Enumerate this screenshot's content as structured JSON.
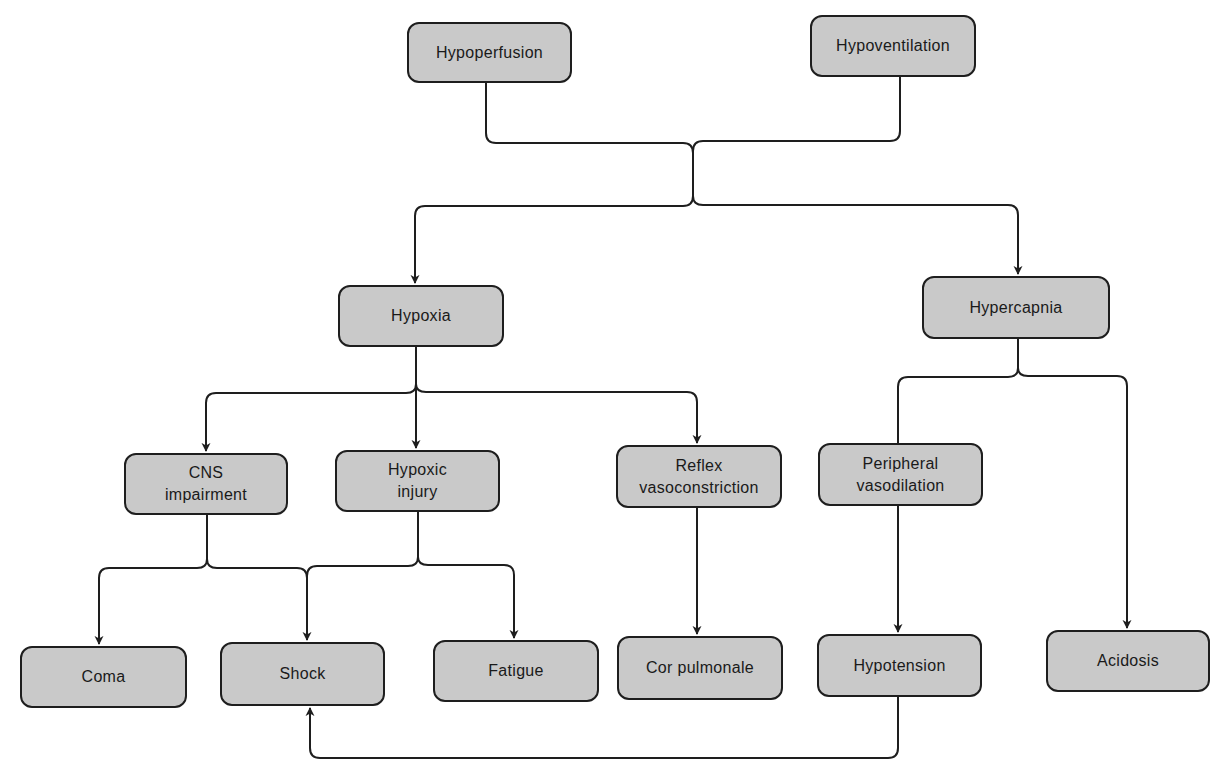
{
  "colors": {
    "node_fill": "#c9c9c9",
    "stroke": "#1e1e1e",
    "background": "#ffffff"
  },
  "nodes": [
    {
      "id": "hypoperfusion",
      "label": "Hypoperfusion",
      "x": 407,
      "y": 22,
      "w": 165,
      "h": 61
    },
    {
      "id": "hypoventilation",
      "label": "Hypoventilation",
      "x": 810,
      "y": 15,
      "w": 166,
      "h": 62
    },
    {
      "id": "hypoxia",
      "label": "Hypoxia",
      "x": 338,
      "y": 285,
      "w": 166,
      "h": 62
    },
    {
      "id": "hypercapnia",
      "label": "Hypercapnia",
      "x": 922,
      "y": 276,
      "w": 188,
      "h": 63
    },
    {
      "id": "cns-impairment",
      "label": "CNS\nimpairment",
      "x": 124,
      "y": 453,
      "w": 164,
      "h": 62
    },
    {
      "id": "hypoxic-injury",
      "label": "Hypoxic\ninjury",
      "x": 335,
      "y": 450,
      "w": 165,
      "h": 62
    },
    {
      "id": "reflex-vasoconstriction",
      "label": "Reflex\nvasoconstriction",
      "x": 616,
      "y": 445,
      "w": 166,
      "h": 63
    },
    {
      "id": "peripheral-vasodilation",
      "label": "Peripheral\nvasodilation",
      "x": 818,
      "y": 443,
      "w": 165,
      "h": 63
    },
    {
      "id": "coma",
      "label": "Coma",
      "x": 20,
      "y": 646,
      "w": 167,
      "h": 62
    },
    {
      "id": "shock",
      "label": "Shock",
      "x": 220,
      "y": 642,
      "w": 165,
      "h": 64
    },
    {
      "id": "fatigue",
      "label": "Fatigue",
      "x": 433,
      "y": 640,
      "w": 166,
      "h": 62
    },
    {
      "id": "cor-pulmonale",
      "label": "Cor pulmonale",
      "x": 617,
      "y": 636,
      "w": 166,
      "h": 64
    },
    {
      "id": "hypotension",
      "label": "Hypotension",
      "x": 817,
      "y": 634,
      "w": 165,
      "h": 63
    },
    {
      "id": "acidosis",
      "label": "Acidosis",
      "x": 1046,
      "y": 630,
      "w": 164,
      "h": 62
    }
  ],
  "edges": [
    {
      "from": "hypoperfusion",
      "to": "hypoxia"
    },
    {
      "from": "hypoperfusion",
      "to": "hypercapnia"
    },
    {
      "from": "hypoventilation",
      "to": "hypoxia"
    },
    {
      "from": "hypoventilation",
      "to": "hypercapnia"
    },
    {
      "from": "hypoxia",
      "to": "cns-impairment"
    },
    {
      "from": "hypoxia",
      "to": "hypoxic-injury"
    },
    {
      "from": "hypoxia",
      "to": "reflex-vasoconstriction"
    },
    {
      "from": "hypercapnia",
      "to": "peripheral-vasodilation"
    },
    {
      "from": "hypercapnia",
      "to": "acidosis"
    },
    {
      "from": "cns-impairment",
      "to": "coma"
    },
    {
      "from": "cns-impairment",
      "to": "shock"
    },
    {
      "from": "hypoxic-injury",
      "to": "shock"
    },
    {
      "from": "hypoxic-injury",
      "to": "fatigue"
    },
    {
      "from": "reflex-vasoconstriction",
      "to": "cor-pulmonale"
    },
    {
      "from": "peripheral-vasodilation",
      "to": "hypotension"
    },
    {
      "from": "hypotension",
      "to": "shock"
    }
  ]
}
